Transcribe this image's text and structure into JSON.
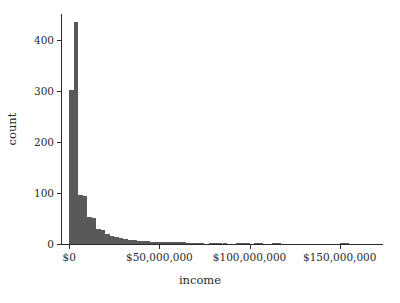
{
  "chart_data": {
    "type": "bar",
    "title": "",
    "subtitle": "",
    "xlabel": "income",
    "ylabel": "count",
    "xlim": [
      -4000000,
      174000000
    ],
    "ylim": [
      0,
      450
    ],
    "grid": false,
    "legend": null,
    "bar_color": "#595959",
    "background_color": "#ffffff",
    "axis_color": "#2b2b2b",
    "binwidth": 2500000,
    "x_tick_values": [
      0,
      50000000,
      100000000,
      150000000
    ],
    "x_tick_labels": [
      "$0",
      "$50,000,000",
      "$100,000,000",
      "$150,000,000"
    ],
    "y_tick_values": [
      0,
      100,
      200,
      300,
      400
    ],
    "y_tick_labels": [
      "0",
      "100",
      "200",
      "300",
      "400"
    ],
    "bins": [
      {
        "x0": 0,
        "x1": 2500000,
        "count": 301
      },
      {
        "x0": 2500000,
        "x1": 5000000,
        "count": 434
      },
      {
        "x0": 5000000,
        "x1": 7500000,
        "count": 96
      },
      {
        "x0": 7500000,
        "x1": 10000000,
        "count": 93
      },
      {
        "x0": 10000000,
        "x1": 12500000,
        "count": 52
      },
      {
        "x0": 12500000,
        "x1": 15000000,
        "count": 50
      },
      {
        "x0": 15000000,
        "x1": 17500000,
        "count": 30
      },
      {
        "x0": 17500000,
        "x1": 20000000,
        "count": 28
      },
      {
        "x0": 20000000,
        "x1": 22500000,
        "count": 19
      },
      {
        "x0": 22500000,
        "x1": 25000000,
        "count": 16
      },
      {
        "x0": 25000000,
        "x1": 27500000,
        "count": 13
      },
      {
        "x0": 27500000,
        "x1": 30000000,
        "count": 11
      },
      {
        "x0": 30000000,
        "x1": 32500000,
        "count": 9
      },
      {
        "x0": 32500000,
        "x1": 35000000,
        "count": 8
      },
      {
        "x0": 35000000,
        "x1": 37500000,
        "count": 7
      },
      {
        "x0": 37500000,
        "x1": 40000000,
        "count": 6
      },
      {
        "x0": 40000000,
        "x1": 42500000,
        "count": 5
      },
      {
        "x0": 42500000,
        "x1": 45000000,
        "count": 5
      },
      {
        "x0": 45000000,
        "x1": 47500000,
        "count": 4
      },
      {
        "x0": 47500000,
        "x1": 50000000,
        "count": 4
      },
      {
        "x0": 50000000,
        "x1": 52500000,
        "count": 4
      },
      {
        "x0": 52500000,
        "x1": 55000000,
        "count": 3
      },
      {
        "x0": 55000000,
        "x1": 57500000,
        "count": 3
      },
      {
        "x0": 57500000,
        "x1": 60000000,
        "count": 3
      },
      {
        "x0": 60000000,
        "x1": 62500000,
        "count": 3
      },
      {
        "x0": 62500000,
        "x1": 65000000,
        "count": 3
      },
      {
        "x0": 65000000,
        "x1": 67500000,
        "count": 2
      },
      {
        "x0": 67500000,
        "x1": 70000000,
        "count": 2
      },
      {
        "x0": 70000000,
        "x1": 72500000,
        "count": 2
      },
      {
        "x0": 72500000,
        "x1": 75000000,
        "count": 1
      },
      {
        "x0": 75000000,
        "x1": 77500000,
        "count": 0
      },
      {
        "x0": 77500000,
        "x1": 80000000,
        "count": 2
      },
      {
        "x0": 80000000,
        "x1": 82500000,
        "count": 2
      },
      {
        "x0": 82500000,
        "x1": 85000000,
        "count": 2
      },
      {
        "x0": 85000000,
        "x1": 87500000,
        "count": 2
      },
      {
        "x0": 87500000,
        "x1": 90000000,
        "count": 0
      },
      {
        "x0": 90000000,
        "x1": 92500000,
        "count": 0
      },
      {
        "x0": 92500000,
        "x1": 95000000,
        "count": 2
      },
      {
        "x0": 95000000,
        "x1": 97500000,
        "count": 2
      },
      {
        "x0": 97500000,
        "x1": 100000000,
        "count": 1
      },
      {
        "x0": 100000000,
        "x1": 102500000,
        "count": 0
      },
      {
        "x0": 102500000,
        "x1": 105000000,
        "count": 1
      },
      {
        "x0": 105000000,
        "x1": 107500000,
        "count": 1
      },
      {
        "x0": 107500000,
        "x1": 110000000,
        "count": 0
      },
      {
        "x0": 110000000,
        "x1": 112500000,
        "count": 0
      },
      {
        "x0": 112500000,
        "x1": 115000000,
        "count": 1
      },
      {
        "x0": 115000000,
        "x1": 117500000,
        "count": 1
      },
      {
        "x0": 117500000,
        "x1": 120000000,
        "count": 0
      },
      {
        "x0": 120000000,
        "x1": 122500000,
        "count": 0
      },
      {
        "x0": 122500000,
        "x1": 125000000,
        "count": 0
      },
      {
        "x0": 125000000,
        "x1": 127500000,
        "count": 0
      },
      {
        "x0": 127500000,
        "x1": 130000000,
        "count": 0
      },
      {
        "x0": 130000000,
        "x1": 132500000,
        "count": 0
      },
      {
        "x0": 132500000,
        "x1": 135000000,
        "count": 0
      },
      {
        "x0": 135000000,
        "x1": 137500000,
        "count": 0
      },
      {
        "x0": 137500000,
        "x1": 140000000,
        "count": 0
      },
      {
        "x0": 140000000,
        "x1": 142500000,
        "count": 0
      },
      {
        "x0": 142500000,
        "x1": 145000000,
        "count": 0
      },
      {
        "x0": 145000000,
        "x1": 147500000,
        "count": 0
      },
      {
        "x0": 147500000,
        "x1": 150000000,
        "count": 0
      },
      {
        "x0": 150000000,
        "x1": 152500000,
        "count": 1
      },
      {
        "x0": 152500000,
        "x1": 155000000,
        "count": 1
      }
    ]
  }
}
